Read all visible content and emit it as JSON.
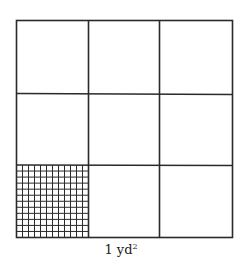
{
  "diagram": {
    "label": {
      "value": "1 yd",
      "exponent": "2"
    },
    "outer_grid": {
      "rows": 3,
      "cols": 3,
      "unit": "ft"
    },
    "inner_grid": {
      "rows": 12,
      "cols": 12,
      "unit": "in",
      "position": "bottom-left"
    },
    "colors": {
      "line": "#2a2a2a",
      "background": "#ffffff"
    }
  }
}
